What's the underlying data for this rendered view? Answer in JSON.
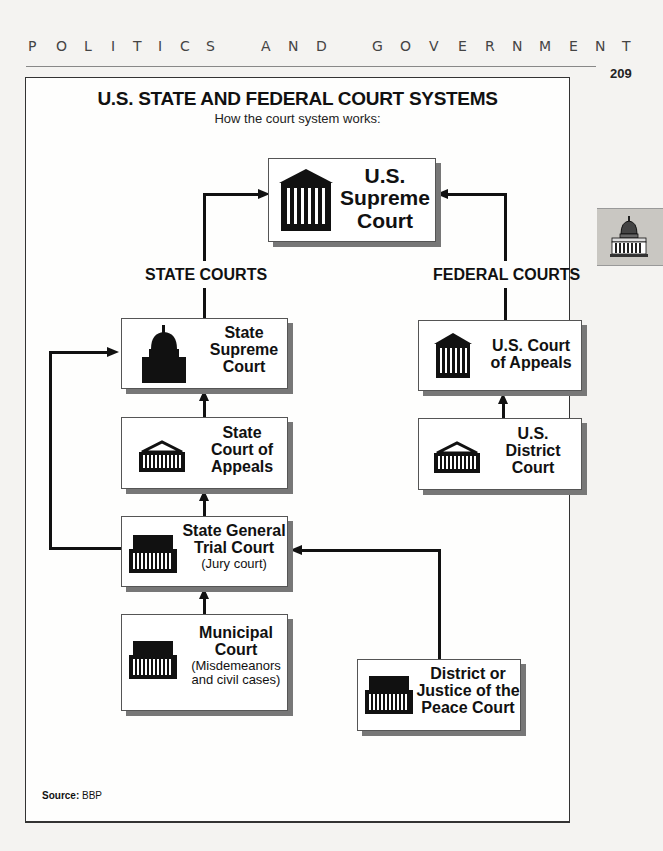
{
  "running_head": {
    "letters": [
      "P",
      "O",
      "L",
      "I",
      "T",
      "I",
      "C",
      "S",
      "A",
      "N",
      "D",
      "G",
      "O",
      "V",
      "E",
      "R",
      "N",
      "M",
      "E",
      "N",
      "T"
    ],
    "text": "POLITICS AND GOVERNMENT"
  },
  "page_number": "209",
  "thumb_tab": {
    "icon": "capitol-building-icon"
  },
  "diagram": {
    "title": "U.S. STATE AND FEDERAL COURT SYSTEMS",
    "subtitle": "How the court system works:",
    "section_labels": {
      "state": "STATE COURTS",
      "federal": "FEDERAL COURTS"
    },
    "nodes": {
      "us_supreme": {
        "lines": [
          "U.S.",
          "Supreme",
          "Court"
        ],
        "icon": "columned-courthouse-icon"
      },
      "state_supreme": {
        "lines": [
          "State",
          "Supreme",
          "Court"
        ],
        "icon": "capitol-dome-icon"
      },
      "state_appeals": {
        "lines": [
          "State",
          "Court of",
          "Appeals"
        ],
        "icon": "pediment-courthouse-icon"
      },
      "state_trial": {
        "lines": [
          "State General",
          "Trial Court"
        ],
        "note": "(Jury court)",
        "icon": "flat-roof-courthouse-icon"
      },
      "municipal": {
        "lines": [
          "Municipal",
          "Court"
        ],
        "note_lines": [
          "(Misdemeanors",
          "and civil cases)"
        ],
        "icon": "flat-roof-courthouse-icon"
      },
      "us_appeals": {
        "lines": [
          "U.S. Court",
          "of Appeals"
        ],
        "icon": "columned-courthouse-icon"
      },
      "us_district": {
        "lines": [
          "U.S.",
          "District",
          "Court"
        ],
        "icon": "pediment-courthouse-icon"
      },
      "district_peace": {
        "lines": [
          "District or",
          "Justice of the",
          "Peace Court"
        ],
        "icon": "flat-roof-courthouse-icon"
      }
    },
    "edges": [
      {
        "from": "state_supreme",
        "to": "us_supreme"
      },
      {
        "from": "us_appeals",
        "to": "us_supreme"
      },
      {
        "from": "state_appeals",
        "to": "state_supreme"
      },
      {
        "from": "state_trial",
        "to": "state_appeals"
      },
      {
        "from": "state_trial",
        "to": "state_supreme"
      },
      {
        "from": "municipal",
        "to": "state_trial"
      },
      {
        "from": "district_peace",
        "to": "state_trial"
      },
      {
        "from": "us_district",
        "to": "us_appeals"
      }
    ],
    "source": {
      "label": "Source:",
      "value": "BBP"
    }
  }
}
